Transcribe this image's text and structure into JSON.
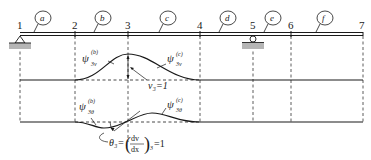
{
  "diagram": {
    "type": "beam-shape-functions",
    "nodes": [
      {
        "label": "1",
        "x": 20
      },
      {
        "label": "2",
        "x": 75
      },
      {
        "label": "3",
        "x": 128
      },
      {
        "label": "4",
        "x": 200
      },
      {
        "label": "5",
        "x": 253
      },
      {
        "label": "6",
        "x": 291
      },
      {
        "label": "7",
        "x": 363
      }
    ],
    "elements": [
      {
        "label": "a",
        "cx": 43
      },
      {
        "label": "b",
        "cx": 103
      },
      {
        "label": "c",
        "cx": 168
      },
      {
        "label": "d",
        "cx": 228
      },
      {
        "label": "e",
        "cx": 273
      },
      {
        "label": "f",
        "cx": 325
      }
    ],
    "supports": [
      {
        "type": "pin",
        "node": "1"
      },
      {
        "type": "roller",
        "node": "5"
      }
    ],
    "upper_curve": {
      "left_label": {
        "base": "ψ",
        "sup": "(b)",
        "sub": "3v"
      },
      "right_label": {
        "base": "ψ",
        "sup": "(c)",
        "sub": "3v"
      },
      "annotation": "v₃=1"
    },
    "lower_curve": {
      "left_label": {
        "base": "ψ",
        "sup": "(b)",
        "sub": "3θ"
      },
      "right_label": {
        "base": "ψ",
        "sup": "(c)",
        "sub": "3θ"
      },
      "annotation_prefix": "θ₃=",
      "annotation_num": "dv",
      "annotation_den": "dx",
      "annotation_subscript": "3",
      "annotation_suffix": "=1"
    },
    "colors": {
      "line": "#1a1a1a",
      "support_fill": "#b5b5b5",
      "dashed": "#333333"
    }
  }
}
